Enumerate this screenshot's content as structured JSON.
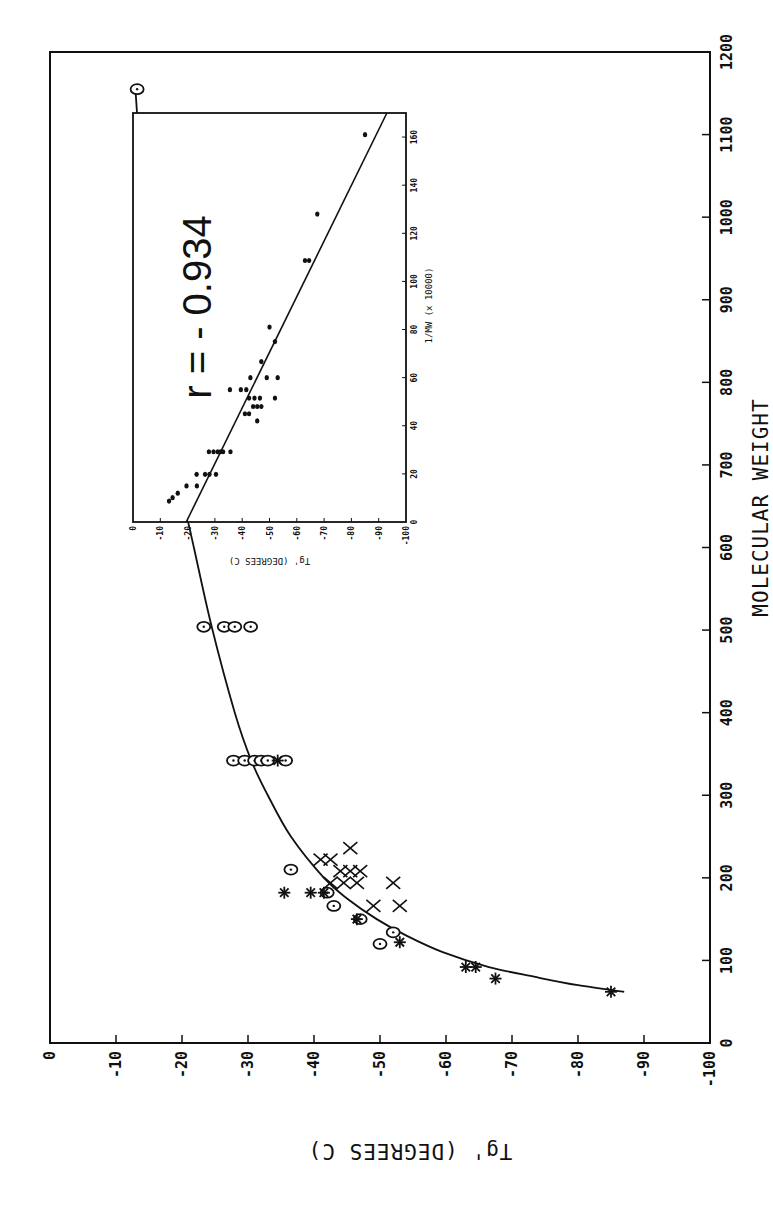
{
  "chart_data": [
    {
      "type": "scatter",
      "title": "",
      "xlabel": "MOLECULAR WEIGHT",
      "ylabel": "Tg'  (DEGREES C)",
      "xlim": [
        0,
        1200
      ],
      "ylim": [
        -100,
        0
      ],
      "xticks": [
        "0",
        "100",
        "200",
        "300",
        "400",
        "500",
        "600",
        "700",
        "800",
        "900",
        "1000",
        "1100",
        "1200"
      ],
      "yticks": [
        "0",
        "-10",
        "-20",
        "-30",
        "-40",
        "-50",
        "-60",
        "-70",
        "-80",
        "-90",
        "-100"
      ],
      "grid": false,
      "legend": null,
      "series": [
        {
          "name": "circles",
          "marker": "circle-dot",
          "points": [
            [
              1155,
              -13.2
            ],
            [
              990,
              -14.5
            ],
            [
              830,
              -16.4
            ],
            [
              666,
              -19.6
            ],
            [
              666,
              -23.4
            ],
            [
              504,
              -23.3
            ],
            [
              504,
              -26.4
            ],
            [
              504,
              -28.0
            ],
            [
              504,
              -30.4
            ],
            [
              342,
              -27.8
            ],
            [
              342,
              -29.5
            ],
            [
              342,
              -31.0
            ],
            [
              342,
              -32.0
            ],
            [
              342,
              -33.0
            ],
            [
              342,
              -35.7
            ],
            [
              210,
              -36.5
            ],
            [
              182,
              -42.0
            ],
            [
              166,
              -43.0
            ],
            [
              150,
              -47.0
            ],
            [
              134,
              -52.0
            ],
            [
              120,
              -50.0
            ]
          ]
        },
        {
          "name": "stars",
          "marker": "asterisk",
          "points": [
            [
              342,
              -34.5
            ],
            [
              182,
              -35.5
            ],
            [
              182,
              -39.5
            ],
            [
              182,
              -41.5
            ],
            [
              150,
              -46.5
            ],
            [
              122,
              -53.0
            ],
            [
              92,
              -63.0
            ],
            [
              92,
              -64.5
            ],
            [
              78,
              -67.5
            ],
            [
              62,
              -85.0
            ]
          ]
        },
        {
          "name": "crosses",
          "marker": "x",
          "points": [
            [
              236,
              -45.5
            ],
            [
              222,
              -41.0
            ],
            [
              222,
              -42.5
            ],
            [
              208,
              -44.0
            ],
            [
              208,
              -45.5
            ],
            [
              208,
              -47.0
            ],
            [
              194,
              -42.5
            ],
            [
              194,
              -44.5
            ],
            [
              194,
              -46.5
            ],
            [
              194,
              -52.0
            ],
            [
              166,
              -49.0
            ],
            [
              166,
              -53.0
            ]
          ]
        }
      ],
      "fit_curve": {
        "label": "fitted curve",
        "points": [
          [
            62,
            -87.0
          ],
          [
            70,
            -80.0
          ],
          [
            80,
            -73.5
          ],
          [
            92,
            -66.5
          ],
          [
            110,
            -59.5
          ],
          [
            130,
            -54.0
          ],
          [
            150,
            -49.5
          ],
          [
            175,
            -45.0
          ],
          [
            200,
            -41.5
          ],
          [
            250,
            -36.5
          ],
          [
            300,
            -33.0
          ],
          [
            342,
            -30.5
          ],
          [
            400,
            -28.0
          ],
          [
            504,
            -24.5
          ],
          [
            600,
            -21.8
          ],
          [
            666,
            -20.0
          ],
          [
            750,
            -18.2
          ],
          [
            830,
            -16.8
          ],
          [
            900,
            -15.8
          ],
          [
            990,
            -14.6
          ],
          [
            1080,
            -13.6
          ],
          [
            1160,
            -12.9
          ]
        ]
      },
      "annotation_position": "top-right inset"
    },
    {
      "type": "scatter",
      "title": "",
      "xlabel": "1/MW  (x 10000)",
      "ylabel": "Tg'  (DEGREES C)",
      "xlim": [
        0,
        170
      ],
      "ylim": [
        -100,
        0
      ],
      "xticks": [
        "0",
        "20",
        "40",
        "60",
        "80",
        "100",
        "120",
        "140",
        "160"
      ],
      "yticks": [
        "0",
        "-10",
        "-20",
        "-30",
        "-40",
        "-50",
        "-60",
        "-70",
        "-80",
        "-90",
        "-100"
      ],
      "annotation": "r = - 0.934",
      "series": [
        {
          "name": "data",
          "marker": "dot",
          "points": [
            [
              8.7,
              -13.2
            ],
            [
              10.1,
              -14.5
            ],
            [
              12.0,
              -16.4
            ],
            [
              15.0,
              -19.6
            ],
            [
              15.0,
              -23.4
            ],
            [
              19.8,
              -23.3
            ],
            [
              19.8,
              -26.4
            ],
            [
              19.8,
              -28.0
            ],
            [
              19.8,
              -30.4
            ],
            [
              29.2,
              -27.8
            ],
            [
              29.2,
              -29.5
            ],
            [
              29.2,
              -31.0
            ],
            [
              29.2,
              -32.0
            ],
            [
              29.2,
              -33.0
            ],
            [
              29.2,
              -35.7
            ],
            [
              42.0,
              -45.5
            ],
            [
              45.0,
              -41.0
            ],
            [
              45.0,
              -42.5
            ],
            [
              48.0,
              -44.0
            ],
            [
              48.0,
              -45.5
            ],
            [
              48.0,
              -47.0
            ],
            [
              51.5,
              -42.5
            ],
            [
              51.5,
              -44.5
            ],
            [
              51.5,
              -46.5
            ],
            [
              51.5,
              -52.0
            ],
            [
              55.0,
              -35.5
            ],
            [
              55.0,
              -39.5
            ],
            [
              55.0,
              -41.5
            ],
            [
              60.0,
              -49.0
            ],
            [
              60.0,
              -53.0
            ],
            [
              60.0,
              -43.0
            ],
            [
              66.7,
              -47.0
            ],
            [
              75.0,
              -52.0
            ],
            [
              81.0,
              -50.0
            ],
            [
              108.7,
              -63.0
            ],
            [
              108.7,
              -64.5
            ],
            [
              128.0,
              -67.5
            ],
            [
              161.0,
              -85.0
            ]
          ]
        }
      ],
      "fit_line": {
        "points": [
          [
            0,
            -19.5
          ],
          [
            170,
            -93.0
          ]
        ]
      }
    }
  ],
  "main_axes": {
    "x_label": "MOLECULAR WEIGHT",
    "y_label": "Tg'  (DEGREES C)"
  },
  "inset": {
    "x_label": "1/MW  (x 10000)",
    "y_label": "Tg'  (DEGREES C)",
    "annotation": "r  =  - 0.934"
  }
}
